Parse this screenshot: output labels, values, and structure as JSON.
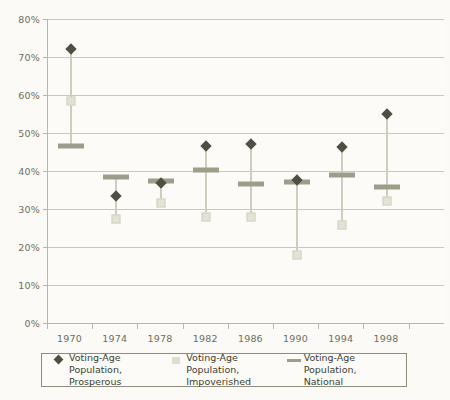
{
  "chart_data": {
    "type": "scatter",
    "title": "",
    "xlabel": "",
    "ylabel": "",
    "categories": [
      "1970",
      "1974",
      "1978",
      "1982",
      "1986",
      "1990",
      "1994",
      "1998"
    ],
    "ylim": [
      0,
      80
    ],
    "ytick_labels": [
      "0%",
      "10%",
      "20%",
      "30%",
      "40%",
      "50%",
      "60%",
      "70%",
      "80%"
    ],
    "ytick_values": [
      0,
      10,
      20,
      30,
      40,
      50,
      60,
      70,
      80
    ],
    "grid": "horizontal",
    "legend_position": "bottom",
    "series": [
      {
        "name": "Voting-Age Population, Prosperous",
        "marker": "diamond",
        "color": "#4e4e43",
        "values": [
          72.0,
          33.3,
          36.8,
          46.5,
          47.0,
          37.7,
          46.3,
          55.0
        ]
      },
      {
        "name": "Voting-Age Population, Impoverished",
        "marker": "square",
        "color": "#e3e3d5",
        "values": [
          58.5,
          27.5,
          31.5,
          28.0,
          28.0,
          17.8,
          25.7,
          32.0
        ]
      },
      {
        "name": "Voting-Age Population, National",
        "marker": "bar",
        "color": "#9d9d8c",
        "values": [
          46.5,
          38.3,
          37.3,
          40.3,
          36.5,
          37.2,
          39.0,
          35.7
        ]
      }
    ]
  },
  "legend": {
    "items": [
      {
        "label": "Voting-Age Population,\nProsperous",
        "key": "diamond-marker"
      },
      {
        "label": "Voting-Age Population,\nImpoverished",
        "key": "square-marker"
      },
      {
        "label": "Voting-Age Population,\nNational",
        "key": "bar-marker"
      }
    ]
  }
}
